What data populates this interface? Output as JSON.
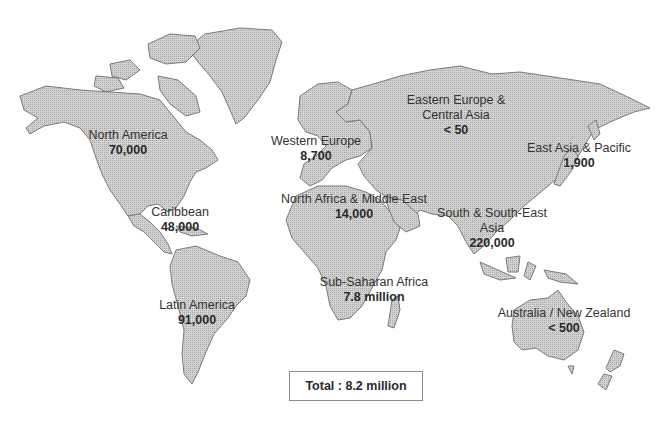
{
  "map": {
    "type": "choropleth-labels",
    "fill_color": "#c8c8c8",
    "regions": [
      {
        "id": "north-america",
        "name": "North America",
        "value": "70,000"
      },
      {
        "id": "caribbean",
        "name": "Caribbean",
        "value": "48,000"
      },
      {
        "id": "latin-america",
        "name": "Latin America",
        "value": "91,000"
      },
      {
        "id": "western-europe",
        "name": "Western Europe",
        "value": "8,700"
      },
      {
        "id": "eastern-europe-central-asia",
        "name": "Eastern Europe &",
        "name2": "Central Asia",
        "value": "< 50"
      },
      {
        "id": "east-asia-pacific",
        "name": "East Asia & Pacific",
        "value": "1,900"
      },
      {
        "id": "north-africa-middle-east",
        "name": "North Africa & Middle East",
        "value": "14,000"
      },
      {
        "id": "south-southeast-asia",
        "name": "South & South-East",
        "name2": "Asia",
        "value": "220,000"
      },
      {
        "id": "sub-saharan-africa",
        "name": "Sub-Saharan Africa",
        "value": "7.8 million"
      },
      {
        "id": "australia-new-zealand",
        "name": "Australia / New Zealand",
        "value": "< 500"
      }
    ],
    "total_label": "Total : 8.2 million"
  }
}
